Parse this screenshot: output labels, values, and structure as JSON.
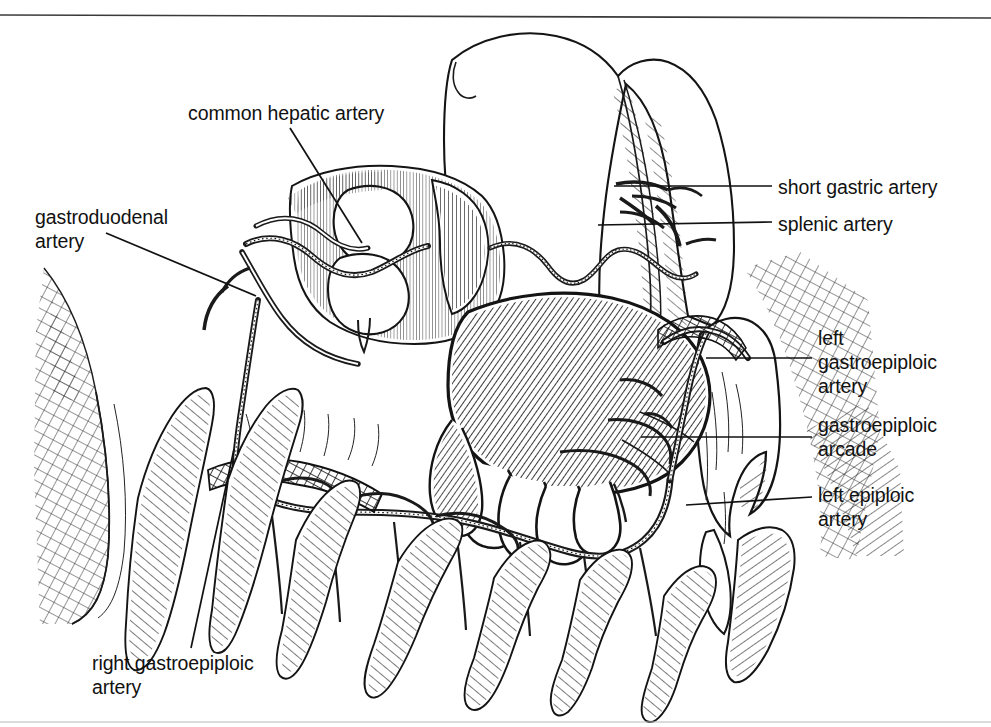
{
  "figure": {
    "kind": "anatomical-line-illustration",
    "style": "pen-and-ink stipple and hatch medical illustration",
    "background_color": "#ffffff",
    "ink_color": "#1a1a1a",
    "canvas": {
      "width": 991,
      "height": 727
    },
    "top_rule": {
      "color": "#3a3a3a",
      "y": 16
    },
    "bottom_rule": {
      "color": "#b9b9b9",
      "y": 722
    }
  },
  "labels": [
    {
      "id": "common-hepatic-artery",
      "lines": [
        "common hepatic artery"
      ],
      "side": "left",
      "x": 188,
      "y": 101,
      "leader": {
        "type": "diagonal",
        "x1": 290,
        "y1": 128,
        "x2": 362,
        "y2": 243
      }
    },
    {
      "id": "gastroduodenal-artery",
      "lines": [
        "gastroduodenal",
        "artery"
      ],
      "side": "left",
      "x": 35,
      "y": 205,
      "leader": {
        "type": "diagonal",
        "x1": 106,
        "y1": 233,
        "x2": 256,
        "y2": 296
      }
    },
    {
      "id": "short-gastric-artery",
      "lines": [
        "short gastric artery"
      ],
      "side": "right",
      "x": 778,
      "y": 175,
      "leader": {
        "type": "horizontal",
        "x1": 614,
        "y1": 186,
        "x2": 772,
        "y2": 186
      }
    },
    {
      "id": "splenic-artery",
      "lines": [
        "splenic artery"
      ],
      "side": "right",
      "x": 778,
      "y": 212,
      "leader": {
        "type": "horizontal",
        "x1": 598,
        "y1": 224,
        "x2": 772,
        "y2": 222
      }
    },
    {
      "id": "left-gastroepiploic-artery",
      "lines": [
        "left",
        "gastroepiploic",
        "artery"
      ],
      "side": "right",
      "x": 818,
      "y": 326,
      "leader": {
        "type": "horizontal",
        "x1": 706,
        "y1": 358,
        "x2": 812,
        "y2": 358
      }
    },
    {
      "id": "gastroepiploic-arcade",
      "lines": [
        "gastroepiploic",
        "arcade"
      ],
      "side": "right",
      "x": 818,
      "y": 413,
      "leader": {
        "type": "horizontal",
        "x1": 641,
        "y1": 437,
        "x2": 812,
        "y2": 437
      }
    },
    {
      "id": "left-epiploic-artery",
      "lines": [
        "left epiploic",
        "artery"
      ],
      "side": "right",
      "x": 818,
      "y": 483,
      "leader": {
        "type": "horizontal",
        "x1": 686,
        "y1": 505,
        "x2": 812,
        "y2": 497
      }
    },
    {
      "id": "right-gastroepiploic-artery",
      "lines": [
        "right gastroepiploic",
        "artery"
      ],
      "side": "left",
      "x": 92,
      "y": 651,
      "leader": {
        "type": "diagonal",
        "x1": 191,
        "y1": 648,
        "x2": 234,
        "y2": 449
      }
    }
  ],
  "structures": [
    {
      "id": "stomach-body",
      "name": "stomach (greater curvature, hatched)"
    },
    {
      "id": "duodenum",
      "name": "duodenum and pylorus"
    },
    {
      "id": "spleen",
      "name": "spleen"
    },
    {
      "id": "greater-omentum",
      "name": "greater omentum with epiploic appendages"
    },
    {
      "id": "transverse-colon",
      "name": "transverse colon"
    },
    {
      "id": "gastroepiploic-arcade-vessel",
      "name": "gastroepiploic vascular arcade"
    }
  ]
}
